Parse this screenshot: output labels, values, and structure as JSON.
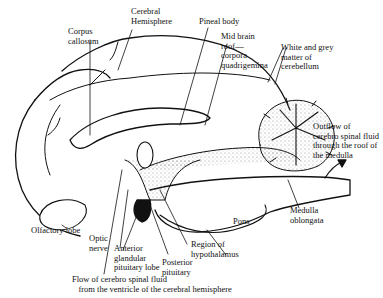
{
  "diagram": {
    "labels": {
      "corpus_callosum": "Corpus\ncallosum",
      "cerebral_hemisphere": "Cerebral\nHemisphere",
      "pineal_body": "Pineal body",
      "mid_brain_roof": "Mid brain\nroof—\ncorpora\nquadrigemina",
      "white_grey_matter": "White and grey\nmatter of\ncerebellum",
      "outflow_csf": "Outflow of\ncerebro spinal fluid\nthrough the roof of\nthe medulla",
      "medulla_oblongata": "Medulla\noblongata",
      "pons": "Pons",
      "olfactory_lobe": "Olfactory lobe",
      "optic_nerve": "Optic\nnerve",
      "anterior_pituitary": "Anterior\nglandular\npituitary lobe",
      "posterior_pituitary": "Posterior\npituitary",
      "region_hypothalamus": "Region of\nhypothalamus",
      "flow_csf": "Flow of cerebro spinal fluid\n   from the ventricle of the cerebral hemisphere"
    },
    "colors": {
      "ink": "#111111",
      "background": "#ffffff",
      "stipple": "#9a9a9a"
    }
  }
}
